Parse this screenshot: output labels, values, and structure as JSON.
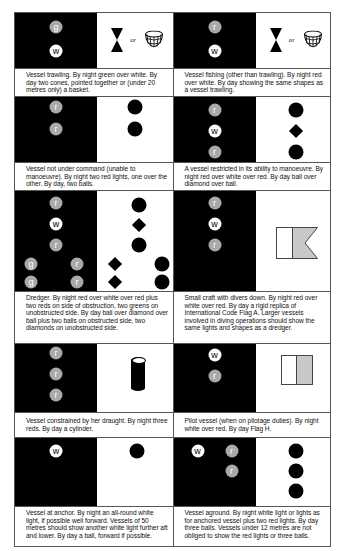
{
  "panels": [
    {
      "id": "trawling",
      "caption": "Vessel trawling. By night green over white. By day two cones, pointed together or (under 20 metres only) a basket.",
      "night_lights": [
        "g",
        "w"
      ],
      "day_shapes": [
        "two-cones",
        "basket"
      ],
      "or_label": "or"
    },
    {
      "id": "fishing",
      "caption": "Vessel fishing (other than trawling). By night red over white. By day showing the same shapes as a vessel trawling.",
      "night_lights": [
        "r",
        "w"
      ],
      "day_shapes": [
        "two-cones",
        "basket"
      ],
      "or_label": "or"
    },
    {
      "id": "not-under-command",
      "caption": "Vessel not under command (unable to manoeuvre). By night two red lights, one over the other. By day, two balls.",
      "night_lights": [
        "r",
        "r"
      ],
      "day_shapes": [
        "ball",
        "ball"
      ]
    },
    {
      "id": "restricted-ability",
      "caption": "A vessel restricted in its ability to manoeuvre. By night red over white over red. By day ball over diamond over ball.",
      "night_lights": [
        "r",
        "w",
        "r"
      ],
      "day_shapes": [
        "ball",
        "diamond",
        "ball"
      ]
    },
    {
      "id": "dredger",
      "caption": "Dredger. By night red over white over red plus two reds on side of obstruction, two greens on unobstructed side. By day ball over diamond over ball plus two balls on obstructed side, two diamonds on unobstructed side.",
      "night_lights": [
        "r",
        "w",
        "r",
        "g",
        "g",
        "r",
        "r"
      ],
      "day_shapes": [
        "ball",
        "diamond",
        "ball",
        "diamond",
        "diamond",
        "ball",
        "ball"
      ]
    },
    {
      "id": "divers-down",
      "caption": "Small craft with divers down. By night red over white over red. By day a rigid replica of International Code Flag A. Larger vessels involved in diving operations should show the same lights and shapes as a dredger.",
      "night_lights": [
        "r",
        "w",
        "r"
      ],
      "day_shapes": [
        "flag-a"
      ]
    },
    {
      "id": "constrained-draught",
      "caption": "Vessel constrained by her draught. By night three reds. By day a cylinder.",
      "night_lights": [
        "r",
        "r",
        "r"
      ],
      "day_shapes": [
        "cylinder"
      ]
    },
    {
      "id": "pilot-vessel",
      "caption": "Pilot vessel (when on pilotage duties). By night white over red.  By day  Flag H.",
      "night_lights": [
        "w",
        "r"
      ],
      "day_shapes": [
        "flag-h"
      ]
    },
    {
      "id": "at-anchor",
      "caption": "Vessel at anchor. By night an all-round white light, if possible well forward. Vessels of 50 metres should show another white light further aft and lower. By day a ball, forward if possible.",
      "night_lights": [
        "w"
      ],
      "day_shapes": [
        "ball"
      ]
    },
    {
      "id": "aground",
      "caption": "Vessel aground. By night white light or lights as for anchored vessel plus two red lights. By day three balls. Vessels under 12 metres are not obliged to show the red lights or three balls.",
      "night_lights": [
        "w",
        "r",
        "r"
      ],
      "day_shapes": [
        "ball",
        "ball",
        "ball"
      ]
    }
  ],
  "colors": {
    "night_background": "#000000",
    "red_light": "#a9a9a9",
    "green_light": "#a9a9a9",
    "white_light": "#ffffff",
    "flag_shade": "#c8c8c8"
  }
}
